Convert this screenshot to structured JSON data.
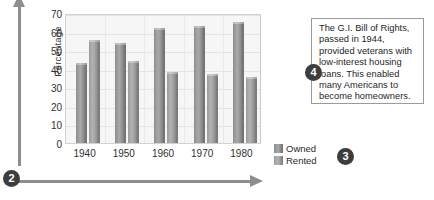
{
  "markers": {
    "axes_marker": "2",
    "legend_marker": "3",
    "annotation_marker": "4"
  },
  "annotation": {
    "text": "The G.I. Bill of Rights, passed in 1944, provided veterans with low-interest housing loans. This enabled many Americans to become homeowners."
  },
  "legend": {
    "items": [
      {
        "label": "Owned",
        "color": "#8d8d8d"
      },
      {
        "label": "Rented",
        "color": "#9b9b9b"
      }
    ]
  },
  "chart_data": {
    "type": "bar",
    "title": "",
    "xlabel": "",
    "ylabel": "Percentage",
    "categories": [
      "1940",
      "1950",
      "1960",
      "1970",
      "1980"
    ],
    "series": [
      {
        "name": "Owned",
        "values": [
          43,
          54,
          62,
          63,
          65
        ]
      },
      {
        "name": "Rented",
        "values": [
          55.5,
          44,
          38,
          37,
          35.5
        ]
      }
    ],
    "ylim": [
      0,
      70
    ],
    "yticks": [
      0,
      10,
      20,
      30,
      40,
      50,
      60,
      70
    ],
    "ytick_labels": [
      "0",
      "10",
      "20",
      "30",
      "40",
      "50",
      "60",
      "70"
    ],
    "grid": true,
    "legend_position": "outside-right-bottom"
  }
}
